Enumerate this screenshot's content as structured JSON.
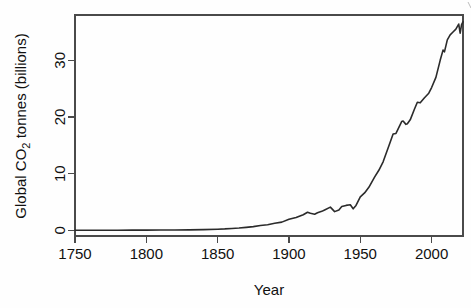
{
  "chart_data": {
    "type": "line",
    "title": "",
    "xlabel": "Year",
    "ylabel": "Global CO2 tonnes (billions)",
    "ylabel_parts": {
      "prefix": "Global CO",
      "sub": "2",
      "suffix": " tonnes (billions)"
    },
    "xlim": [
      1750,
      2022
    ],
    "ylim": [
      -1.0,
      38.0
    ],
    "xticks": [
      1750,
      1800,
      1850,
      1900,
      1950,
      2000
    ],
    "xtick_labels": [
      "1750",
      "1800",
      "1850",
      "1900",
      "1950",
      "2000"
    ],
    "yticks": [
      0,
      10,
      20,
      30
    ],
    "ytick_labels": [
      "0",
      "10",
      "20",
      "30"
    ],
    "grid": false,
    "legend": "none",
    "series": [
      {
        "name": "Global CO2 emissions",
        "x": [
          1750,
          1760,
          1770,
          1780,
          1790,
          1800,
          1810,
          1820,
          1830,
          1840,
          1850,
          1855,
          1860,
          1865,
          1870,
          1875,
          1880,
          1885,
          1890,
          1895,
          1900,
          1905,
          1910,
          1913,
          1915,
          1918,
          1920,
          1923,
          1925,
          1929,
          1932,
          1935,
          1937,
          1940,
          1943,
          1945,
          1947,
          1950,
          1953,
          1956,
          1960,
          1963,
          1966,
          1970,
          1973,
          1975,
          1979,
          1980,
          1982,
          1983,
          1985,
          1988,
          1990,
          1992,
          1995,
          1998,
          2000,
          2003,
          2006,
          2008,
          2009,
          2011,
          2013,
          2015,
          2017,
          2019,
          2020,
          2021,
          2022
        ],
        "values": [
          0.01,
          0.01,
          0.02,
          0.02,
          0.03,
          0.03,
          0.05,
          0.06,
          0.08,
          0.12,
          0.2,
          0.25,
          0.33,
          0.4,
          0.53,
          0.66,
          0.85,
          1.0,
          1.25,
          1.45,
          1.95,
          2.25,
          2.75,
          3.2,
          3.0,
          2.85,
          3.1,
          3.35,
          3.6,
          4.1,
          3.3,
          3.6,
          4.2,
          4.4,
          4.5,
          3.8,
          4.4,
          5.9,
          6.6,
          7.6,
          9.4,
          10.6,
          12.1,
          14.9,
          17.0,
          17.1,
          19.2,
          19.3,
          18.7,
          18.8,
          19.5,
          21.4,
          22.6,
          22.5,
          23.4,
          24.2,
          25.2,
          27.0,
          30.0,
          31.8,
          31.5,
          33.6,
          34.5,
          35.0,
          35.5,
          36.4,
          34.8,
          36.3,
          36.8
        ]
      }
    ],
    "annotations": []
  },
  "axes": {
    "y_axis_name": "y-axis",
    "x_axis_name": "x-axis"
  }
}
